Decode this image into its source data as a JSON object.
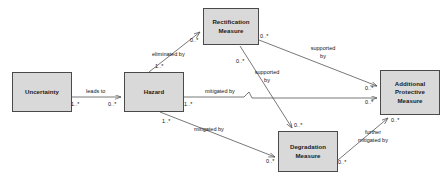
{
  "diagram": {
    "type": "uml-class-diagram",
    "title": "",
    "canvas": {
      "width": 448,
      "height": 188,
      "background": "#ffffff"
    },
    "style": {
      "node_fill": "#d9d9d9",
      "node_stroke": "#4a4a4a",
      "line_color": "#555555",
      "text_color": "#1a1a1a"
    },
    "nodes": [
      {
        "id": "uncertainty",
        "label": "Uncertainty",
        "x": 12,
        "y": 72,
        "w": 60,
        "h": 40
      },
      {
        "id": "hazard",
        "label": "Hazard",
        "x": 124,
        "y": 72,
        "w": 60,
        "h": 40
      },
      {
        "id": "rectification",
        "label": "Rectification\nMeasure",
        "x": 203,
        "y": 8,
        "w": 56,
        "h": 37
      },
      {
        "id": "degradation",
        "label": "Degradation\nMeasure",
        "x": 278,
        "y": 131,
        "w": 60,
        "h": 41
      },
      {
        "id": "additional_protective",
        "label": "Additional\nProtective\nMeasure",
        "x": 380,
        "y": 70,
        "w": 60,
        "h": 45
      }
    ],
    "edges": [
      {
        "id": "uncertainty-leads-to-hazard",
        "from": "uncertainty",
        "to": "hazard",
        "label": "leads to",
        "source_multiplicity": "1..*",
        "target_multiplicity": "0..*"
      },
      {
        "id": "hazard-eliminated-by-rectification",
        "from": "hazard",
        "to": "rectification",
        "label": "eliminated by",
        "source_multiplicity": "1..*",
        "target_multiplicity": "0..*"
      },
      {
        "id": "hazard-mitigated-by-additional-protective",
        "from": "hazard",
        "to": "additional_protective",
        "label": "mitigated by",
        "source_multiplicity": "1..*",
        "target_multiplicity": "0..*"
      },
      {
        "id": "hazard-mitigated-by-degradation",
        "from": "hazard",
        "to": "degradation",
        "label": "mitigated by",
        "source_multiplicity": "1..*",
        "target_multiplicity": "0..*"
      },
      {
        "id": "rectification-supported-by-additional-protective",
        "from": "rectification",
        "to": "additional_protective",
        "label": "supported\nby",
        "source_multiplicity": "0..*",
        "target_multiplicity": "0..*"
      },
      {
        "id": "rectification-supported-by-degradation",
        "from": "rectification",
        "to": "degradation",
        "label": "supported\nby",
        "source_multiplicity": "0..*",
        "target_multiplicity": "0..*"
      },
      {
        "id": "degradation-further-mitigated-by-additional-protective",
        "from": "degradation",
        "to": "additional_protective",
        "label": "further\nmitigated by",
        "source_multiplicity": "0..*",
        "target_multiplicity": "0..*"
      }
    ],
    "labels": {
      "leads_to": "leads to",
      "eliminated_by": "eliminated by",
      "mitigated_by_upper": "mitigated by",
      "mitigated_by_lower": "mitigated by",
      "supported_by_upper": "supported\nby",
      "supported_by_lower": "supported\nby",
      "further_mitigated_by": "further\nmitigated by"
    },
    "multiplicities": {
      "uncertainty_out": "1..*",
      "hazard_in_from_uncertainty": "0..*",
      "hazard_up_to_rectification": "1..*",
      "rectification_in_from_hazard": "0..*",
      "hazard_right_to_apm": "1..*",
      "apm_in_from_hazard": "0..*",
      "hazard_down_to_degradation": "1..*",
      "degradation_in_from_hazard": "0..*",
      "rectification_out_right": "0..*",
      "apm_in_from_rectification": "0..*",
      "degradation_in_from_rectification": "0..*",
      "degradation_out_right": "0..*",
      "apm_in_from_degradation": "0..*"
    }
  }
}
